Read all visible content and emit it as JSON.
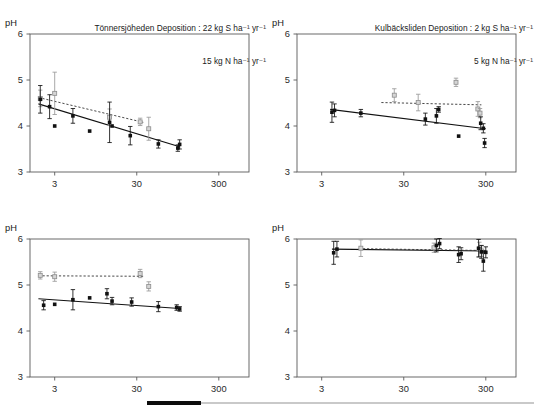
{
  "figure": {
    "units_sup": "-1",
    "footer_bar_color": "#0d0d0d",
    "footer_line_color": "#c9c9c9"
  },
  "panels": [
    {
      "id": "top-left",
      "title_line1": "Tönnersjöheden Deposition : 22 kg S ha⁻¹ yr⁻¹",
      "title_line2": "15 kg N ha⁻¹ yr⁻¹",
      "ylabel": "pH",
      "has_title": true
    },
    {
      "id": "top-right",
      "title_line1": "Kulbäcksliden Deposition : 2 kg S ha⁻¹ yr⁻¹",
      "title_line2": "5 kg N ha⁻¹ yr⁻¹",
      "ylabel": "pH",
      "has_title": true
    },
    {
      "id": "bottom-left",
      "title_line1": "",
      "title_line2": "",
      "ylabel": "pH",
      "has_title": false
    },
    {
      "id": "bottom-right",
      "title_line1": "",
      "title_line2": "",
      "ylabel": "pH",
      "has_title": false
    }
  ],
  "chart_data": [
    {
      "panel": "top-left",
      "type": "scatter",
      "title": "Tönnersjöheden Deposition : 22 kg S ha-1 yr-1 / 15 kg N ha-1 yr-1",
      "xlabel": "",
      "ylabel": "pH",
      "xscale": "log",
      "xlim": [
        1.5,
        700
      ],
      "ylim": [
        3,
        6
      ],
      "xticks": [
        3,
        30,
        300
      ],
      "xticklabels": [
        "3",
        "30",
        "300"
      ],
      "yticks": [
        3,
        4,
        5,
        6
      ],
      "yticklabels": [
        "3",
        "4",
        "5",
        "6"
      ],
      "grid": false,
      "legend": "none",
      "series": [
        {
          "name": "black-filled-squares",
          "marker": "filled-square",
          "color": "#111111",
          "points": [
            {
              "x": 2.0,
              "y": 4.58,
              "err": 0.3
            },
            {
              "x": 2.6,
              "y": 4.42,
              "err": 0.26
            },
            {
              "x": 3.0,
              "y": 4.0,
              "err": 0.0
            },
            {
              "x": 5.0,
              "y": 4.22,
              "err": 0.16
            },
            {
              "x": 8.0,
              "y": 3.89,
              "err": 0.0
            },
            {
              "x": 14.0,
              "y": 4.08,
              "err": 0.44
            },
            {
              "x": 15.0,
              "y": 4.0,
              "err": 0.0
            },
            {
              "x": 25.0,
              "y": 3.79,
              "err": 0.2
            },
            {
              "x": 55.0,
              "y": 3.61,
              "err": 0.09
            },
            {
              "x": 95.0,
              "y": 3.52,
              "err": 0.07
            },
            {
              "x": 100.0,
              "y": 3.6,
              "err": 0.1
            }
          ]
        },
        {
          "name": "grey-open-squares",
          "marker": "open-square",
          "color": "#d5d5d5",
          "points": [
            {
              "x": 2.0,
              "y": 4.6,
              "err": 0.18
            },
            {
              "x": 3.0,
              "y": 4.71,
              "err": 0.46
            },
            {
              "x": 14.0,
              "y": 4.19,
              "err": 0.18
            },
            {
              "x": 33.0,
              "y": 4.09,
              "err": 0.08
            },
            {
              "x": 42.0,
              "y": 3.94,
              "err": 0.25
            }
          ]
        }
      ],
      "fits": [
        {
          "name": "solid-regression",
          "style": "solid",
          "x0": 1.9,
          "y0": 4.48,
          "x1": 100.0,
          "y1": 3.55
        },
        {
          "name": "dashed-regression",
          "style": "dashed",
          "x0": 1.9,
          "y0": 4.62,
          "x1": 36.0,
          "y1": 4.08
        }
      ]
    },
    {
      "panel": "top-right",
      "type": "scatter",
      "title": "Kulbäcksliden Deposition : 2 kg S ha-1 yr-1 / 5 kg N ha-1 yr-1",
      "xlabel": "",
      "ylabel": "pH",
      "xscale": "log",
      "xlim": [
        1.5,
        700
      ],
      "ylim": [
        3,
        6
      ],
      "xticks": [
        3,
        30,
        300
      ],
      "xticklabels": [
        "3",
        "30",
        "300"
      ],
      "yticks": [
        3,
        4,
        5,
        6
      ],
      "yticklabels": [
        "3",
        "4",
        "5",
        "6"
      ],
      "grid": false,
      "legend": "none",
      "series": [
        {
          "name": "black-filled-squares",
          "marker": "filled-square",
          "color": "#111111",
          "points": [
            {
              "x": 4.0,
              "y": 4.3,
              "err": 0.22
            },
            {
              "x": 4.3,
              "y": 4.34,
              "err": 0.14
            },
            {
              "x": 9.0,
              "y": 4.28,
              "err": 0.08
            },
            {
              "x": 55.0,
              "y": 4.15,
              "err": 0.13
            },
            {
              "x": 75.0,
              "y": 4.22,
              "err": 0.16
            },
            {
              "x": 80.0,
              "y": 4.36,
              "err": 0.06
            },
            {
              "x": 140.0,
              "y": 3.78,
              "err": 0.0
            },
            {
              "x": 260.0,
              "y": 4.06,
              "err": 0.14
            },
            {
              "x": 280.0,
              "y": 3.95,
              "err": 0.1
            },
            {
              "x": 290.0,
              "y": 3.63,
              "err": 0.1
            }
          ]
        },
        {
          "name": "grey-open-squares",
          "marker": "open-square",
          "color": "#d5d5d5",
          "points": [
            {
              "x": 23.0,
              "y": 4.67,
              "err": 0.14
            },
            {
              "x": 45.0,
              "y": 4.51,
              "err": 0.18
            },
            {
              "x": 130.0,
              "y": 4.95,
              "err": 0.09
            },
            {
              "x": 240.0,
              "y": 4.37,
              "err": 0.16
            },
            {
              "x": 255.0,
              "y": 4.28,
              "err": 0.1
            }
          ]
        }
      ],
      "fits": [
        {
          "name": "solid-regression",
          "style": "solid",
          "x0": 3.8,
          "y0": 4.36,
          "x1": 300.0,
          "y1": 3.94
        },
        {
          "name": "dashed-regression",
          "style": "dashed",
          "x0": 16.0,
          "y0": 4.51,
          "x1": 265.0,
          "y1": 4.46
        }
      ]
    },
    {
      "panel": "bottom-left",
      "type": "scatter",
      "title": "",
      "xlabel": "",
      "ylabel": "pH",
      "xscale": "log",
      "xlim": [
        1.5,
        700
      ],
      "ylim": [
        3,
        6
      ],
      "xticks": [
        3,
        30,
        300
      ],
      "xticklabels": [
        "3",
        "30",
        "300"
      ],
      "yticks": [
        3,
        4,
        5,
        6
      ],
      "yticklabels": [
        "3",
        "4",
        "5",
        "6"
      ],
      "grid": false,
      "legend": "none",
      "series": [
        {
          "name": "black-filled-squares",
          "marker": "filled-square",
          "color": "#111111",
          "points": [
            {
              "x": 2.2,
              "y": 4.56,
              "err": 0.1
            },
            {
              "x": 3.0,
              "y": 4.58,
              "err": 0.0
            },
            {
              "x": 5.0,
              "y": 4.68,
              "err": 0.22
            },
            {
              "x": 8.0,
              "y": 4.72,
              "err": 0.0
            },
            {
              "x": 13.0,
              "y": 4.81,
              "err": 0.11
            },
            {
              "x": 15.0,
              "y": 4.65,
              "err": 0.08
            },
            {
              "x": 26.0,
              "y": 4.63,
              "err": 0.09
            },
            {
              "x": 55.0,
              "y": 4.53,
              "err": 0.11
            },
            {
              "x": 92.0,
              "y": 4.51,
              "err": 0.06
            },
            {
              "x": 100.0,
              "y": 4.48,
              "err": 0.05
            }
          ]
        },
        {
          "name": "grey-open-squares",
          "marker": "open-square",
          "color": "#d5d5d5",
          "points": [
            {
              "x": 2.0,
              "y": 5.21,
              "err": 0.08
            },
            {
              "x": 3.0,
              "y": 5.18,
              "err": 0.1
            },
            {
              "x": 33.0,
              "y": 5.25,
              "err": 0.09
            },
            {
              "x": 42.0,
              "y": 4.97,
              "err": 0.1
            }
          ]
        }
      ],
      "fits": [
        {
          "name": "solid-regression",
          "style": "solid",
          "x0": 1.9,
          "y0": 4.7,
          "x1": 100.0,
          "y1": 4.49
        },
        {
          "name": "dashed-regression",
          "style": "dashed",
          "x0": 1.9,
          "y0": 5.2,
          "x1": 36.0,
          "y1": 5.19
        }
      ]
    },
    {
      "panel": "bottom-right",
      "type": "scatter",
      "title": "",
      "xlabel": "",
      "ylabel": "pH",
      "xscale": "log",
      "xlim": [
        1.5,
        700
      ],
      "ylim": [
        3,
        6
      ],
      "xticks": [
        3,
        30,
        300
      ],
      "xticklabels": [
        "3",
        "30",
        "300"
      ],
      "yticks": [
        3,
        4,
        5,
        6
      ],
      "yticklabels": [
        "3",
        "4",
        "5",
        "6"
      ],
      "grid": false,
      "legend": "none",
      "series": [
        {
          "name": "black-filled-squares",
          "marker": "filled-square",
          "color": "#111111",
          "points": [
            {
              "x": 4.2,
              "y": 5.7,
              "err": 0.25
            },
            {
              "x": 4.6,
              "y": 5.78,
              "err": 0.17
            },
            {
              "x": 75.0,
              "y": 5.86,
              "err": 0.14
            },
            {
              "x": 82.0,
              "y": 5.9,
              "err": 0.11
            },
            {
              "x": 140.0,
              "y": 5.66,
              "err": 0.17
            },
            {
              "x": 150.0,
              "y": 5.68,
              "err": 0.13
            },
            {
              "x": 245.0,
              "y": 5.8,
              "err": 0.19
            },
            {
              "x": 265.0,
              "y": 5.72,
              "err": 0.14
            },
            {
              "x": 280.0,
              "y": 5.52,
              "err": 0.22
            },
            {
              "x": 300.0,
              "y": 5.71,
              "err": 0.12
            }
          ]
        },
        {
          "name": "grey-open-squares",
          "marker": "open-square",
          "color": "#d5d5d5",
          "points": [
            {
              "x": 9.0,
              "y": 5.8,
              "err": 0.18
            },
            {
              "x": 70.0,
              "y": 5.81,
              "err": 0.1
            },
            {
              "x": 250.0,
              "y": 5.77,
              "err": 0.16
            },
            {
              "x": 268.0,
              "y": 5.74,
              "err": 0.12
            }
          ]
        }
      ],
      "fits": [
        {
          "name": "solid-regression",
          "style": "solid",
          "x0": 4.0,
          "y0": 5.78,
          "x1": 305.0,
          "y1": 5.74
        },
        {
          "name": "dashed-regression",
          "style": "dashed",
          "x0": 8.5,
          "y0": 5.79,
          "x1": 290.0,
          "y1": 5.75
        }
      ]
    }
  ]
}
